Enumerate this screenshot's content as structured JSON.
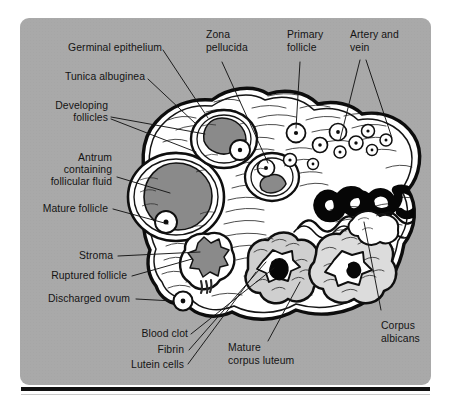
{
  "figure": {
    "background_color": "#a9a9a9",
    "ink_color": "#111111"
  },
  "labels": {
    "germinal_epithelium": "Germinal epithelium",
    "tunica_albuginea": "Tunica albuginea",
    "developing_follicles_l1": "Developing",
    "developing_follicles_l2": "follicles",
    "antrum_l1": "Antrum",
    "antrum_l2": "containing",
    "antrum_l3": "follicular fluid",
    "mature_follicle": "Mature follicle",
    "stroma": "Stroma",
    "ruptured_follicle": "Ruptured follicle",
    "discharged_ovum": "Discharged ovum",
    "zona_pellucida_l1": "Zona",
    "zona_pellucida_l2": "pellucida",
    "primary_follicle_l1": "Primary",
    "primary_follicle_l2": "follicle",
    "artery_and_vein_l1": "Artery and",
    "artery_and_vein_l2": "vein",
    "corpus_albicans_l1": "Corpus",
    "corpus_albicans_l2": "albicans",
    "blood_clot": "Blood clot",
    "fibrin": "Fibrin",
    "lutein_cells": "Lutein cells",
    "mature_corpus_luteum_l1": "Mature",
    "mature_corpus_luteum_l2": "corpus luteum"
  },
  "structures": [
    {
      "name": "germinal-epithelium",
      "description": "outer single cell layer covering the ovary"
    },
    {
      "name": "tunica-albuginea",
      "description": "dense connective tissue capsule beneath the epithelium"
    },
    {
      "name": "developing-follicles",
      "description": "two maturing follicles with antral cavities"
    },
    {
      "name": "mature-follicle",
      "description": "large graafian follicle with antrum and oocyte"
    },
    {
      "name": "antrum",
      "description": "cavity containing follicular fluid"
    },
    {
      "name": "stroma",
      "description": "supporting connective tissue of the ovary"
    },
    {
      "name": "ruptured-follicle",
      "description": "collapsed follicle after ovulation"
    },
    {
      "name": "discharged-ovum",
      "description": "released ovum outside the ovary"
    },
    {
      "name": "zona-pellucida",
      "description": "glycoprotein coat around the oocyte"
    },
    {
      "name": "primary-follicle",
      "description": "small early follicles in the cortex"
    },
    {
      "name": "artery-and-vein",
      "description": "hilum vessels entering the ovary"
    },
    {
      "name": "mature-corpus-luteum",
      "description": "yellow body with central blood clot and fibrin"
    },
    {
      "name": "blood-clot",
      "description": "dark clot at the centre of the corpus luteum"
    },
    {
      "name": "fibrin",
      "description": "pale fibrin rim around the clot"
    },
    {
      "name": "lutein-cells",
      "description": "granulosa lutein cell mass of the corpus luteum"
    },
    {
      "name": "corpus-albicans",
      "description": "white scar of the regressed corpus luteum"
    }
  ],
  "colors": {
    "panel": "#a9a9a9",
    "antrum_fill": "#8a8a8a",
    "luteum_fill": "#cfcfcf",
    "albicans_fill": "#dcdcdc",
    "tissue_white": "#ffffff",
    "clot_black": "#0a0a0a"
  }
}
